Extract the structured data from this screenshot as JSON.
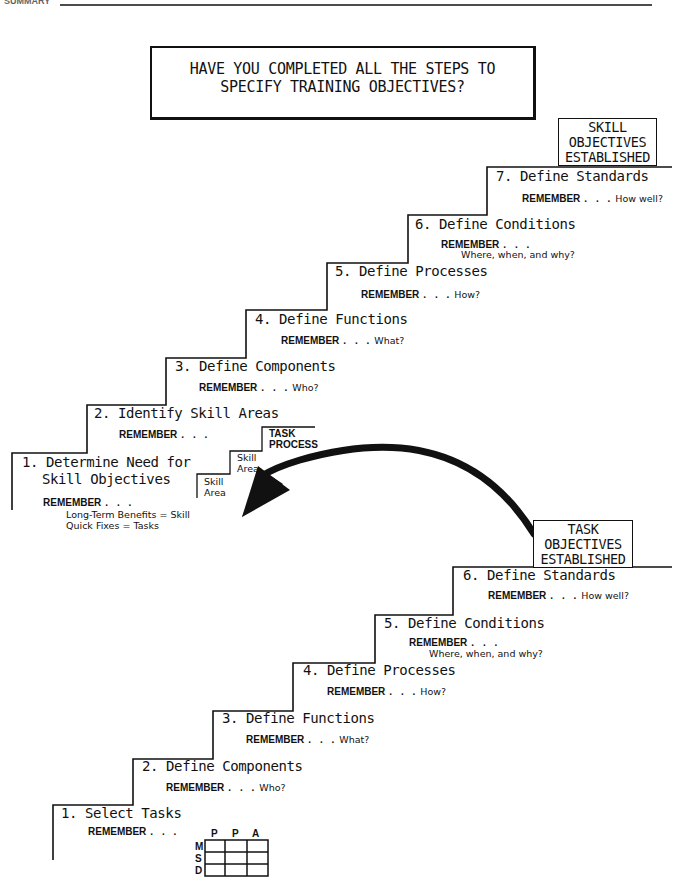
{
  "header": {
    "section_label": "SUMMARY"
  },
  "title": {
    "line1": "HAVE YOU COMPLETED ALL THE STEPS TO",
    "line2": "SPECIFY TRAINING OBJECTIVES?"
  },
  "skill_staircase": {
    "result_box": [
      "SKILL",
      "OBJECTIVES",
      "ESTABLISHED"
    ],
    "steps": [
      {
        "label": "1. Determine Need for",
        "label2": "Skill Objectives",
        "remember": "REMEMBER",
        "hint": "",
        "notes": [
          "Long-Term Benefits = Skill",
          "Quick Fixes = Tasks"
        ]
      },
      {
        "label": "2. Identify Skill Areas",
        "remember": "REMEMBER",
        "hint": ""
      },
      {
        "label": "3. Define Components",
        "remember": "REMEMBER",
        "hint": "Who?"
      },
      {
        "label": "4. Define Functions",
        "remember": "REMEMBER",
        "hint": "What?"
      },
      {
        "label": "5. Define Processes",
        "remember": "REMEMBER",
        "hint": "How?"
      },
      {
        "label": "6. Define Conditions",
        "remember": "REMEMBER",
        "hint": "Where, when, and why?"
      },
      {
        "label": "7. Define Standards",
        "remember": "REMEMBER",
        "hint": "How well?"
      }
    ],
    "mini_staircase": {
      "levels": [
        "Skill Area",
        "Skill Area",
        "TASK PROCESS"
      ],
      "level_lines": [
        [
          "Skill",
          "Area"
        ],
        [
          "Skill",
          "Area"
        ],
        [
          "TASK",
          "PROCESS"
        ]
      ]
    }
  },
  "task_staircase": {
    "result_box": [
      "TASK",
      "OBJECTIVES",
      "ESTABLISHED"
    ],
    "steps": [
      {
        "label": "1. Select Tasks",
        "remember": "REMEMBER",
        "hint": ""
      },
      {
        "label": "2. Define Components",
        "remember": "REMEMBER",
        "hint": "Who?"
      },
      {
        "label": "3. Define Functions",
        "remember": "REMEMBER",
        "hint": "What?"
      },
      {
        "label": "4. Define Processes",
        "remember": "REMEMBER",
        "hint": "How?"
      },
      {
        "label": "5. Define Conditions",
        "remember": "REMEMBER",
        "hint": "Where, when, and why?"
      },
      {
        "label": "6. Define Standards",
        "remember": "REMEMBER",
        "hint": "How well?"
      }
    ],
    "matrix": {
      "columns": [
        "P",
        "P",
        "A"
      ],
      "rows": [
        "M",
        "S",
        "D"
      ]
    }
  },
  "dots": ". . ."
}
